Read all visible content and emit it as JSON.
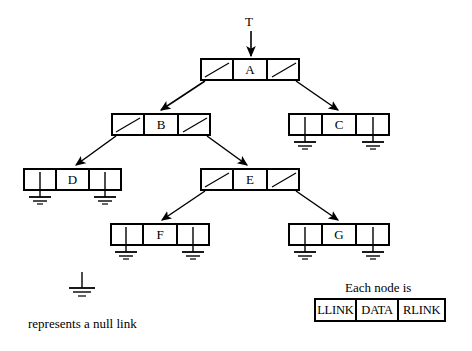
{
  "diagram": {
    "title_label": "T",
    "kind": "binary-tree-linked-representation",
    "nodes": [
      {
        "id": "A",
        "data": "A",
        "x": 200,
        "y": 58,
        "w": 100,
        "h": 23,
        "llink": "pointer",
        "rlink": "pointer"
      },
      {
        "id": "B",
        "data": "B",
        "x": 111,
        "y": 113,
        "w": 100,
        "h": 23,
        "llink": "pointer",
        "rlink": "pointer"
      },
      {
        "id": "C",
        "data": "C",
        "x": 288,
        "y": 113,
        "w": 102,
        "h": 23,
        "llink": "null",
        "rlink": "null"
      },
      {
        "id": "D",
        "data": "D",
        "x": 23,
        "y": 168,
        "w": 99,
        "h": 23,
        "llink": "null",
        "rlink": "null"
      },
      {
        "id": "E",
        "data": "E",
        "x": 200,
        "y": 168,
        "w": 100,
        "h": 23,
        "llink": "pointer",
        "rlink": "pointer"
      },
      {
        "id": "F",
        "data": "F",
        "x": 110,
        "y": 223,
        "w": 100,
        "h": 23,
        "llink": "null",
        "rlink": "null"
      },
      {
        "id": "G",
        "data": "G",
        "x": 288,
        "y": 223,
        "w": 102,
        "h": 23,
        "llink": "null",
        "rlink": "null"
      }
    ],
    "edges": [
      {
        "from": "T",
        "to": "A",
        "type": "root-pointer"
      },
      {
        "from": "A.llink",
        "to": "B",
        "type": "left-child"
      },
      {
        "from": "A.rlink",
        "to": "C",
        "type": "right-child"
      },
      {
        "from": "B.llink",
        "to": "D",
        "type": "left-child"
      },
      {
        "from": "B.rlink",
        "to": "E",
        "type": "right-child"
      },
      {
        "from": "E.llink",
        "to": "F",
        "type": "left-child"
      },
      {
        "from": "E.rlink",
        "to": "G",
        "type": "right-child"
      }
    ]
  },
  "legend": {
    "null_link_text": "represents a null link",
    "each_node_text": "Each node is",
    "node_fields": [
      "LLINK",
      "DATA",
      "RLINK"
    ]
  },
  "colors": {
    "ink": "#000000",
    "background": "#ffffff"
  }
}
